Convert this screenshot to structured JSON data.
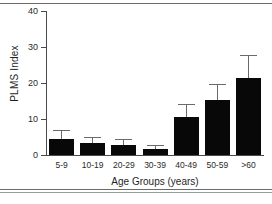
{
  "figure": {
    "background": "#ffffff",
    "bar_color": "#080808",
    "error_bar_color": "#6a6a6a",
    "axis_color": "#4a4a4a"
  },
  "chart_data": {
    "type": "bar",
    "title": "",
    "xlabel": "Age Groups (years)",
    "ylabel": "PLMS Index",
    "categories": [
      "5-9",
      "10-19",
      "20-29",
      "30-39",
      "40-49",
      "50-59",
      ">60"
    ],
    "values": [
      4.5,
      3.3,
      2.8,
      1.6,
      10.5,
      15.3,
      21.5
    ],
    "errors_upper": [
      6.7,
      4.6,
      4.2,
      2.6,
      14.0,
      19.5,
      27.5
    ],
    "error_type": "upper-only",
    "ylim": [
      0,
      40
    ],
    "yticks": [
      0,
      10,
      20,
      30,
      40
    ],
    "ytick_labels": [
      "0",
      "10",
      "20",
      "30",
      "40"
    ],
    "grid": false,
    "legend": "none"
  }
}
